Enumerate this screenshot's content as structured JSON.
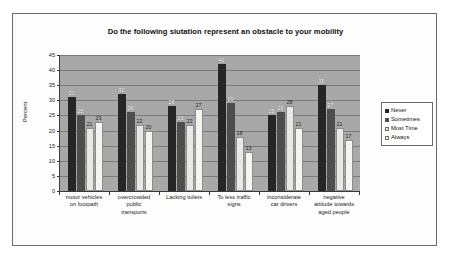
{
  "chart_data": {
    "type": "bar",
    "title": "Do the following siutation represent an obstacle to your mobility",
    "xlabel": "",
    "ylabel": "Percent",
    "ylim": [
      0,
      45
    ],
    "yticks": [
      0,
      5,
      10,
      15,
      20,
      25,
      30,
      35,
      40,
      45
    ],
    "grid": true,
    "legend_position": "right",
    "categories": [
      "motor vehicles on footpath",
      "overcrowded public transports",
      "Lacking toilets",
      "To less traffic signs",
      "inconsiderate car drivers",
      "negative attitude towards aged people"
    ],
    "category_lines": [
      [
        "motor vehicles",
        "on footpath"
      ],
      [
        "overcrowded",
        "public",
        "transports"
      ],
      [
        "Lacking toilets"
      ],
      [
        "To less traffic",
        "signs"
      ],
      [
        "inconsiderate",
        "car drivers"
      ],
      [
        "negative",
        "attitude towards",
        "aged people"
      ]
    ],
    "series": [
      {
        "name": "Never",
        "color": "#262626",
        "values": [
          31,
          32,
          28,
          42,
          25,
          35
        ]
      },
      {
        "name": "Sometimes",
        "color": "#4d4d4d",
        "values": [
          25,
          26,
          23,
          29,
          26,
          27
        ]
      },
      {
        "name": "Most Time",
        "color": "#e8e8e4",
        "values": [
          21,
          22,
          22,
          18,
          28,
          21
        ]
      },
      {
        "name": "Always",
        "color": "#f4f4f0",
        "values": [
          23,
          20,
          27,
          13,
          21,
          17
        ]
      }
    ]
  }
}
